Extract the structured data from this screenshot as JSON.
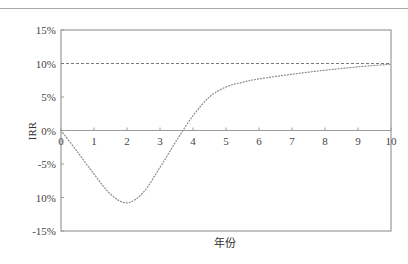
{
  "chart_data": {
    "type": "line",
    "title": "",
    "xlabel": "年份",
    "ylabel": "IRR",
    "xlim": [
      0,
      10
    ],
    "ylim": [
      -15,
      15
    ],
    "x_ticks": [
      "0",
      "1",
      "2",
      "3",
      "4",
      "5",
      "6",
      "7",
      "8",
      "9",
      "10"
    ],
    "y_ticks": [
      "15%",
      "10%",
      "5%",
      "0%",
      "-5%",
      "10%",
      "-15%"
    ],
    "y_tick_values": [
      15,
      10,
      5,
      0,
      -5,
      -10,
      -15
    ],
    "grid": false,
    "legend": null,
    "reference_line": {
      "y": 10,
      "style": "dashed",
      "label": ""
    },
    "series": [
      {
        "name": "IRR",
        "style": "dotted",
        "x": [
          0,
          0.5,
          1,
          1.5,
          2,
          2.5,
          3,
          3.5,
          4,
          4.5,
          5,
          5.5,
          6,
          7,
          8,
          9,
          10
        ],
        "values": [
          0,
          -3.2,
          -6.5,
          -9.5,
          -10.8,
          -9.2,
          -5.5,
          -1.5,
          2.2,
          5.0,
          6.5,
          7.2,
          7.7,
          8.4,
          9.0,
          9.5,
          9.9
        ]
      }
    ]
  }
}
